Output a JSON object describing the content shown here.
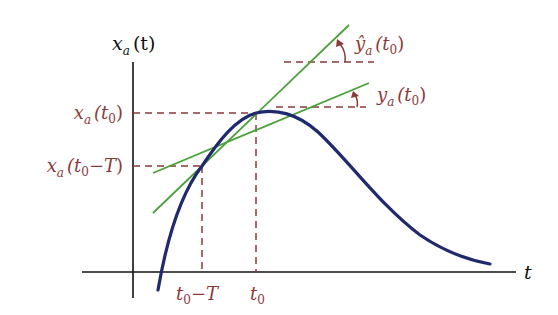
{
  "diagram": {
    "colors": {
      "axis": "#111111",
      "curve": "#1f2a6e",
      "tangent": "#4aa03a",
      "annotation": "#8b3a3a"
    },
    "axes": {
      "y_label": {
        "main": "x",
        "sub": "a",
        "arg": "(t)"
      },
      "x_label": "t"
    },
    "y_ticks": [
      {
        "id": "xa_t0",
        "main": "x",
        "sub": "a",
        "open": "(t",
        "argsub": "0",
        "rest": "",
        "close": ")"
      },
      {
        "id": "xa_t0_minus_T",
        "main": "x",
        "sub": "a",
        "open": "(t",
        "argsub": "0",
        "rest": "−T",
        "close": ")"
      }
    ],
    "x_ticks": [
      {
        "id": "t0_minus_T",
        "main": "t",
        "sub": "0",
        "rest": "−T"
      },
      {
        "id": "t0",
        "main": "t",
        "sub": "0",
        "rest": ""
      }
    ],
    "slope_labels": [
      {
        "id": "yhat_a_t0",
        "main": "ŷ",
        "sub": "a",
        "open": "(t",
        "argsub": "0",
        "close": ")",
        "meaning": "tangent slope at t0"
      },
      {
        "id": "y_a_t0",
        "main": "y",
        "sub": "a",
        "open": "(t",
        "argsub": "0",
        "close": ")",
        "meaning": "secant slope between t0-T and t0"
      }
    ],
    "points": {
      "t0": {
        "x": 256,
        "y": 113
      },
      "t0_minus_T": {
        "x": 202,
        "y": 166
      }
    }
  }
}
